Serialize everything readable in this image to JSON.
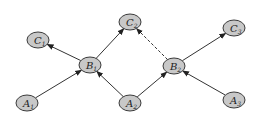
{
  "diagram": {
    "type": "directed-graph",
    "colors": {
      "node_fill": "#c8c8c8",
      "node_stroke": "#3a3a3a",
      "edge": "#333333",
      "background": "#ffffff"
    },
    "nodes": [
      {
        "id": "C1",
        "letter": "C",
        "sub": "1",
        "x": 38,
        "y": 40
      },
      {
        "id": "C2",
        "letter": "C",
        "sub": "2",
        "x": 130,
        "y": 22
      },
      {
        "id": "C3",
        "letter": "C",
        "sub": "3",
        "x": 234,
        "y": 28
      },
      {
        "id": "B1",
        "letter": "B",
        "sub": "1",
        "x": 90,
        "y": 65
      },
      {
        "id": "B2",
        "letter": "B",
        "sub": "2",
        "x": 174,
        "y": 66
      },
      {
        "id": "A1",
        "letter": "A",
        "sub": "1",
        "x": 27,
        "y": 103
      },
      {
        "id": "A2",
        "letter": "A",
        "sub": "2",
        "x": 130,
        "y": 103
      },
      {
        "id": "A3",
        "letter": "A",
        "sub": "3",
        "x": 234,
        "y": 100
      }
    ],
    "edges": [
      {
        "from": "A1",
        "to": "B1",
        "style": "solid"
      },
      {
        "from": "A2",
        "to": "B1",
        "style": "solid"
      },
      {
        "from": "B1",
        "to": "C1",
        "style": "solid"
      },
      {
        "from": "B1",
        "to": "C2",
        "style": "solid"
      },
      {
        "from": "A2",
        "to": "B2",
        "style": "solid"
      },
      {
        "from": "A3",
        "to": "B2",
        "style": "solid"
      },
      {
        "from": "B2",
        "to": "C3",
        "style": "solid"
      },
      {
        "from": "B2",
        "to": "C2",
        "style": "dashed"
      }
    ]
  }
}
